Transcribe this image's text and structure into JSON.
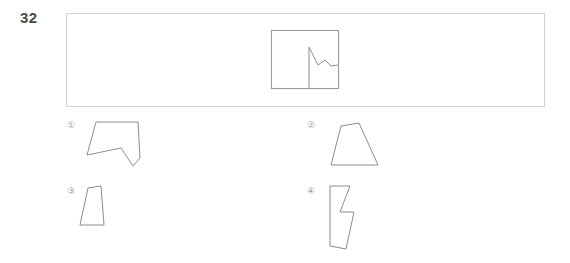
{
  "page": {
    "background_color": "#ffffff",
    "width": 570,
    "height": 263
  },
  "question": {
    "number": "32",
    "type": "visual-spatial-reasoning",
    "prompt_text": ""
  },
  "stimulus": {
    "frame": {
      "x": 66,
      "y": 13,
      "width": 479,
      "height": 94,
      "border_color": "#d2d2d2"
    },
    "inner_box": {
      "label": "occluding-square",
      "x": 271,
      "y": 30,
      "width": 67,
      "height": 58,
      "stroke_color": "#9a9a9a"
    },
    "partial_figure": {
      "label": "partial-zigzag-figure",
      "stroke_color": "#8d8d8d",
      "description": "vertical line rising from box bottom edge with a zigzag notch near the top extending right to the box edge"
    }
  },
  "options": [
    {
      "id": "option-1",
      "badge": "①",
      "badge_plain": "1",
      "shape_name": "notched-pentagon",
      "stroke_color": "#8d8d8d"
    },
    {
      "id": "option-2",
      "badge": "②",
      "badge_plain": "2",
      "shape_name": "trapezoid",
      "stroke_color": "#8d8d8d"
    },
    {
      "id": "option-3",
      "badge": "③",
      "badge_plain": "3",
      "shape_name": "slanted-quadrilateral",
      "stroke_color": "#8d8d8d"
    },
    {
      "id": "option-4",
      "badge": "④",
      "badge_plain": "4",
      "shape_name": "lightning-bolt-polygon",
      "stroke_color": "#8d8d8d"
    }
  ],
  "chart_data": {
    "type": "diagram",
    "title": "",
    "shapes": {
      "stimulus_partial_path": "M 309 88 L 309 47 L 318 65 L 325 60 L 331 66 L 338 65",
      "option_1_path": "M 87 155 L 96 122 L 138 122 L 140 158 L 133 166 L 121 148 Z",
      "option_2_path": "M 331 165 L 341 126 L 359 123 L 378 165 Z",
      "option_3_path": "M 80 225 L 88 188 L 101 186 L 104 225 Z",
      "option_4_path": "M 330 246 L 330 186 L 350 186 L 340 212 L 354 212 L 346 249 Z"
    }
  }
}
